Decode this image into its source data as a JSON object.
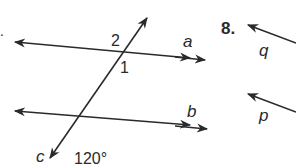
{
  "diagram": {
    "problem7": {
      "prefix": ".",
      "lines": [
        {
          "name": "a",
          "label": "a"
        },
        {
          "name": "b",
          "label": "b"
        },
        {
          "name": "c",
          "label": "c"
        }
      ],
      "angle_labels": {
        "angle1": "1",
        "angle2": "2",
        "given": "120°"
      }
    },
    "problem8": {
      "number": "8.",
      "lines": [
        {
          "name": "q",
          "label": "q"
        },
        {
          "name": "p",
          "label": "p"
        }
      ]
    },
    "colors": {
      "stroke": "#2a2a2a",
      "background": "#ffffff"
    }
  }
}
